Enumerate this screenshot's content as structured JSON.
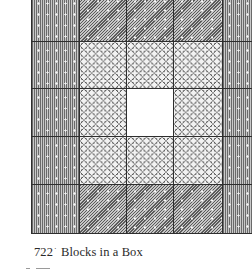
{
  "figure": {
    "caption_number": "722",
    "caption_separator": "·",
    "caption_title": "Blocks in a Box",
    "grid": {
      "columns": 5,
      "rows": 5,
      "legend": {
        "V": "vertical-stripe-dotted",
        "D": "diagonal-stripe-dotted",
        "R": "interlocking-rings",
        "W": "plain-white"
      },
      "layout": [
        [
          "V",
          "D",
          "D",
          "D",
          "V"
        ],
        [
          "V",
          "R",
          "R",
          "R",
          "V"
        ],
        [
          "V",
          "R",
          "W",
          "R",
          "V"
        ],
        [
          "V",
          "R",
          "R",
          "R",
          "V"
        ],
        [
          "V",
          "D",
          "D",
          "D",
          "V"
        ]
      ]
    },
    "colors": {
      "grid_line": "#2e2e2e",
      "stripe_gray": "#9a9a9a",
      "ring_line": "#4a4a4a",
      "background": "#ffffff",
      "caption_text": "#2a2a2a"
    }
  }
}
